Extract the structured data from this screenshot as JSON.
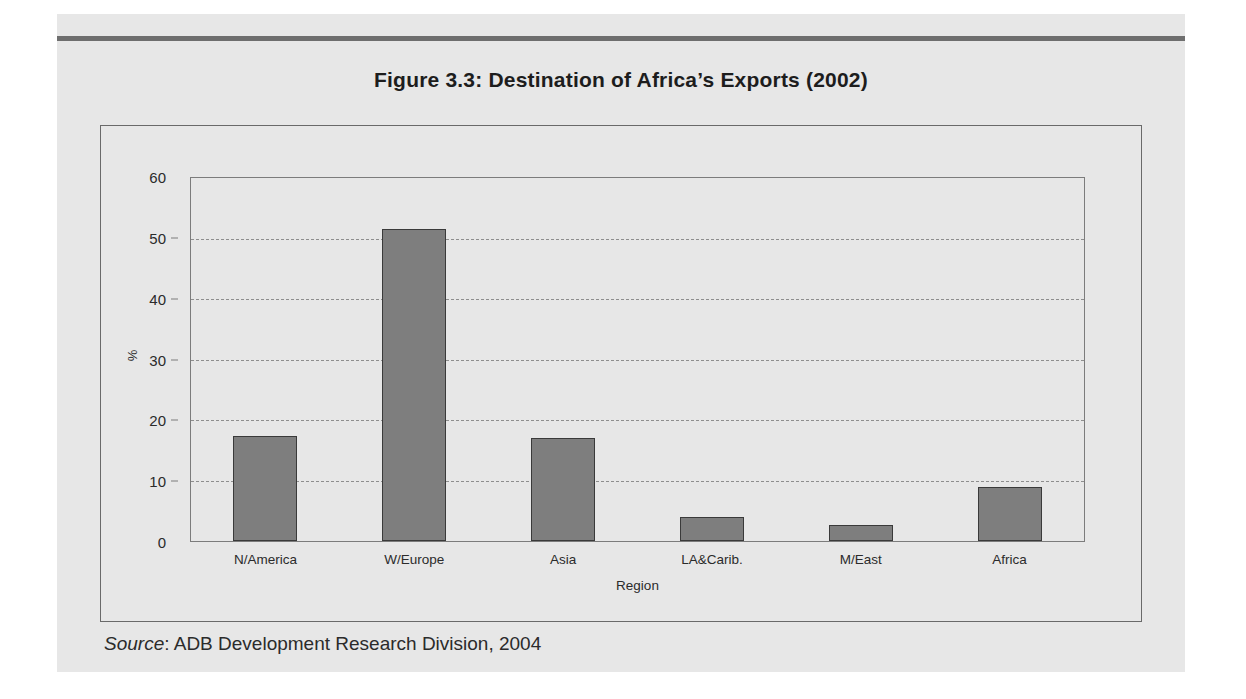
{
  "figure": {
    "title": "Figure 3.3:  Destination of Africa’s Exports (2002)",
    "source_label": "Source",
    "source_separator": ": ",
    "source_text": "ADB Development Research Division, 2004"
  },
  "colors": {
    "page_background": "#e7e7e7",
    "bar_fill": "#7e7e7e",
    "bar_border": "#3a3a3a",
    "frame": "#7c7c7c",
    "gridline": "#8e8e8e",
    "rule": "#6e6e6e",
    "text": "#2b2b2b"
  },
  "chart_data": {
    "type": "bar",
    "title": "Figure 3.3:  Destination of Africa’s Exports (2002)",
    "categories": [
      "N/America",
      "W/Europe",
      "Asia",
      "LA&Carib.",
      "M/East",
      "Africa"
    ],
    "values": [
      17.2,
      51.3,
      16.9,
      4.0,
      2.6,
      8.9
    ],
    "xlabel": "Region",
    "ylabel": "%",
    "ylim": [
      0,
      60
    ],
    "yticks": [
      0,
      10,
      20,
      30,
      40,
      50,
      60
    ],
    "ytick_labels": [
      "0",
      "10",
      "20",
      "30",
      "40",
      "50",
      "60"
    ],
    "grid": true,
    "grid_style": "dashed-horizontal",
    "legend": null,
    "legend_position": "none",
    "series": [
      {
        "name": "Share of Africa's exports",
        "values": [
          17.2,
          51.3,
          16.9,
          4.0,
          2.6,
          8.9
        ]
      }
    ]
  }
}
